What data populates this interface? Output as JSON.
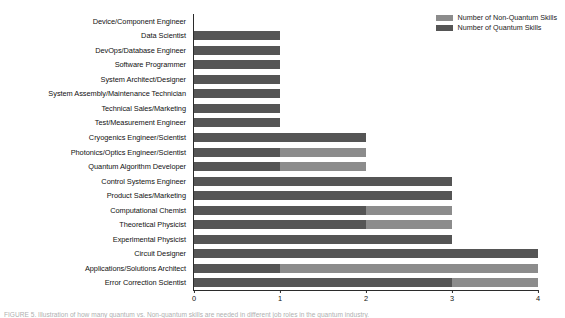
{
  "legend": {
    "position": "top-right",
    "entries": [
      {
        "label": "Number of Non-Quantum Skills",
        "color": "#8c8c8c",
        "icon": "legend-swatch-icon"
      },
      {
        "label": "Number of Quantum Skills",
        "color": "#555555",
        "icon": "legend-swatch-icon"
      }
    ]
  },
  "caption": {
    "text": "FIGURE 5. Illustration of how many quantum vs. Non-quantum skills are needed in different job roles in the quantum industry."
  },
  "chart_data": {
    "type": "bar",
    "orientation": "horizontal",
    "stacked": true,
    "title": "",
    "xlabel": "",
    "ylabel": "",
    "xlim": [
      0,
      4
    ],
    "xticks": [
      0,
      1,
      2,
      3,
      4
    ],
    "xtick_labels": [
      "0",
      "1",
      "2",
      "3",
      "4"
    ],
    "grid": false,
    "categories": [
      "Device/Component Engineer",
      "Data Scientist",
      "DevOps/Database Engineer",
      "Software Programmer",
      "System Architect/Designer",
      "System Assembly/Maintenance Technician",
      "Technical Sales/Marketing",
      "Test/Measurement Engineer",
      "Cryogenics Engineer/Scientist",
      "Photonics/Optics Engineer/Scientist",
      "Quantum Algorithm Developer",
      "Control Systems Engineer",
      "Product Sales/Marketing",
      "Computational Chemist",
      "Theoretical Physicist",
      "Experimental Physicist",
      "Circuit Designer",
      "Applications/Solutions Architect",
      "Error Correction Scientist"
    ],
    "series": [
      {
        "name": "Number of Quantum Skills",
        "color": "#555555",
        "values": [
          0,
          1,
          1,
          1,
          1,
          1,
          1,
          1,
          2,
          1,
          1,
          3,
          3,
          2,
          2,
          3,
          4,
          1,
          3
        ]
      },
      {
        "name": "Number of Non-Quantum Skills",
        "color": "#8c8c8c",
        "values": [
          0,
          0,
          0,
          0,
          0,
          0,
          0,
          0,
          0,
          1,
          1,
          0,
          0,
          1,
          1,
          0,
          0,
          3,
          1
        ]
      }
    ],
    "totals": [
      0,
      1,
      1,
      1,
      1,
      1,
      1,
      1,
      2,
      2,
      2,
      3,
      3,
      3,
      3,
      3,
      4,
      4,
      4
    ]
  }
}
